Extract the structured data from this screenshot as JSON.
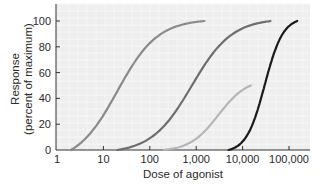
{
  "chart_data": {
    "type": "line",
    "title": "",
    "xlabel": "Dose of agonist",
    "ylabel": "Response",
    "ylabel_sub": "(percent of maximum)",
    "xscale": "log",
    "xlim": [
      1,
      300000
    ],
    "ylim": [
      0,
      110
    ],
    "grid": true,
    "legend": "none",
    "x_ticks": [
      1,
      10,
      100,
      1000,
      10000,
      100000
    ],
    "x_tick_labels": [
      "1",
      "10",
      "100",
      "1,000",
      "10,000",
      "100,000"
    ],
    "y_ticks": [
      0,
      20,
      40,
      60,
      80,
      100
    ],
    "y_tick_labels": [
      "0",
      "20",
      "40",
      "60",
      "80",
      "100"
    ],
    "series": [
      {
        "name": "curve-1",
        "color": "#8a8a8a",
        "ec50": 20,
        "hill": 1.0,
        "max": 100,
        "x_start": 2,
        "x_end": 1500,
        "x": [
          2,
          5,
          10,
          20,
          50,
          100,
          300,
          1500
        ],
        "values": [
          1,
          17,
          38,
          55,
          76,
          88,
          97,
          100
        ]
      },
      {
        "name": "curve-2",
        "color": "#6e6e6e",
        "ec50": 800,
        "hill": 1.0,
        "max": 100,
        "x_start": 20,
        "x_end": 40000,
        "x": [
          20,
          100,
          300,
          800,
          2000,
          5000,
          15000,
          40000
        ],
        "values": [
          0,
          5,
          22,
          50,
          75,
          90,
          98,
          100
        ]
      },
      {
        "name": "curve-3",
        "color": "#b5b5b5",
        "ec50": 3000,
        "hill": 1.4,
        "max": 50,
        "x_start": 200,
        "x_end": 15000,
        "x": [
          200,
          1000,
          2000,
          3000,
          5000,
          10000,
          15000
        ],
        "values": [
          0,
          4,
          17,
          25,
          36,
          47,
          50
        ]
      },
      {
        "name": "curve-4",
        "color": "#1a1a1a",
        "ec50": 30000,
        "hill": 2.2,
        "max": 100,
        "x_start": 5000,
        "x_end": 150000,
        "x": [
          5000,
          10000,
          20000,
          30000,
          50000,
          100000,
          150000
        ],
        "values": [
          0,
          8,
          30,
          50,
          75,
          95,
          100
        ]
      }
    ]
  }
}
